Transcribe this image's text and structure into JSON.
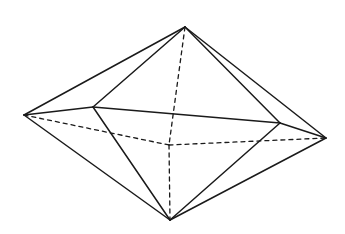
{
  "diagram": {
    "title": "",
    "type": "octahedron",
    "stroke_color": "#1a1a1a",
    "background": "#ffffff",
    "vertices": {
      "top": [
        185,
        27
      ],
      "left": [
        24,
        115
      ],
      "front_left": [
        93,
        107
      ],
      "front_right": [
        280,
        123
      ],
      "right": [
        326,
        138
      ],
      "bottom": [
        170,
        220
      ],
      "center": [
        169,
        145
      ]
    },
    "solid_edges": [
      [
        "top",
        "left"
      ],
      [
        "top",
        "front_left"
      ],
      [
        "top",
        "front_right"
      ],
      [
        "top",
        "right"
      ],
      [
        "left",
        "front_left"
      ],
      [
        "front_left",
        "front_right"
      ],
      [
        "front_right",
        "right"
      ],
      [
        "left",
        "bottom"
      ],
      [
        "front_left",
        "bottom"
      ],
      [
        "front_right",
        "bottom"
      ],
      [
        "right",
        "bottom"
      ]
    ],
    "dashed_edges": [
      [
        "left",
        "center"
      ],
      [
        "center",
        "right"
      ],
      [
        "top",
        "center"
      ],
      [
        "center",
        "bottom"
      ]
    ]
  }
}
